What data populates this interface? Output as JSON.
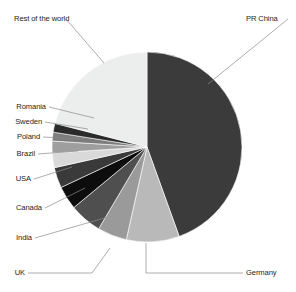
{
  "chart_data": {
    "type": "pie",
    "title": "",
    "subtitle": "",
    "xlabel": "",
    "ylabel": "",
    "legend_position": "none",
    "labels_position": "outside-with-leader-lines",
    "grid": false,
    "categories": [
      "PR China",
      "Germany",
      "UK",
      "India",
      "Canada",
      "USA",
      "Brazil",
      "Poland",
      "Sweden",
      "Romania",
      "Rest of the world"
    ],
    "values": [
      44.5,
      9.0,
      5.0,
      5.5,
      4.0,
      3.5,
      2.5,
      2.0,
      1.5,
      1.5,
      21.0
    ],
    "units": "percent",
    "colors": [
      "#3b3b3b",
      "#b9b9b9",
      "#9a9a9a",
      "#4f4f4f",
      "#0d0d0d",
      "#3a3a3a",
      "#d9d9d9",
      "#9e9e9e",
      "#7d7d7d",
      "#2b2b2b",
      "#eceded"
    ],
    "start_angle_deg": 0,
    "direction": "clockwise",
    "center": {
      "x": 147,
      "y": 147
    },
    "radius": 95
  },
  "labels": {
    "rest_of_the_world": "Rest of the world",
    "pr_china": "PR China",
    "romania": "Romania",
    "sweden": "Sweden",
    "poland": "Poland",
    "brazil": "Brazil",
    "usa": "USA",
    "canada": "Canada",
    "india": "India",
    "uk": "UK",
    "germany": "Germany"
  }
}
